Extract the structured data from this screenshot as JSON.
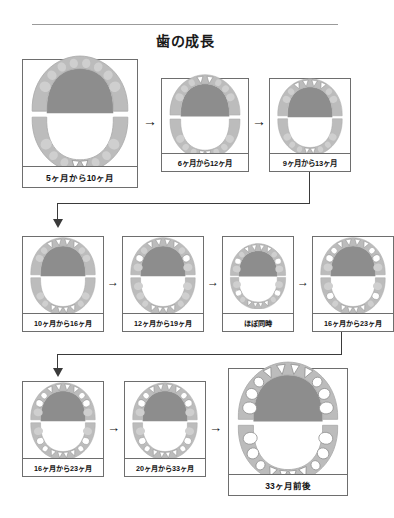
{
  "document": {
    "title": "歯の成長",
    "rule": "horizontal-rule"
  },
  "arrow_glyph": "→",
  "panels": [
    {
      "id": "p1",
      "caption": "5ヶ月から10ヶ月",
      "row": 1,
      "col": 1,
      "size": "large"
    },
    {
      "id": "p2",
      "caption": "6ヶ月から12ヶ月",
      "row": 1,
      "col": 2,
      "size": "small"
    },
    {
      "id": "p3",
      "caption": "9ヶ月から13ヶ月",
      "row": 1,
      "col": 3,
      "size": "small"
    },
    {
      "id": "p4",
      "caption": "10ヶ月から16ヶ月",
      "row": 2,
      "col": 1,
      "size": "small"
    },
    {
      "id": "p5",
      "caption": "12ヶ月から19ヶ月",
      "row": 2,
      "col": 2,
      "size": "small"
    },
    {
      "id": "p6",
      "caption": "ほぼ同時",
      "row": 2,
      "col": 3,
      "size": "small"
    },
    {
      "id": "p7",
      "caption": "16ヶ月から23ヶ月",
      "row": 2,
      "col": 4,
      "size": "small"
    },
    {
      "id": "p8",
      "caption": "16ヶ月から23ヶ月",
      "row": 3,
      "col": 1,
      "size": "small"
    },
    {
      "id": "p9",
      "caption": "20ヶ月から33ヶ月",
      "row": 3,
      "col": 2,
      "size": "small"
    },
    {
      "id": "p10",
      "caption": "33ヶ月前後",
      "row": 3,
      "col": 3,
      "size": "large"
    }
  ],
  "colors": {
    "palate": "#8d8d8d",
    "gum": "#bcbcbc",
    "unerupted_tooth": "#cfcfcf",
    "erupted_tooth": "#ffffff",
    "tooth_outline": "#8f8f8f",
    "panel_border": "#6e6e6e",
    "connector": "#3a3a3a",
    "text": "#121212",
    "rule": "#9b9b9b"
  },
  "chart_data": {
    "type": "diagram",
    "title": "歯の成長",
    "stages": [
      {
        "caption": "5ヶ月から10ヶ月",
        "upper_erupted": [],
        "lower_erupted": [
          "lower-central-incisors"
        ]
      },
      {
        "caption": "6ヶ月から12ヶ月",
        "upper_erupted": [
          "upper-central-incisors"
        ],
        "lower_erupted": [
          "lower-central-incisors"
        ]
      },
      {
        "caption": "9ヶ月から13ヶ月",
        "upper_erupted": [
          "upper-central-incisors",
          "upper-lateral-incisors"
        ],
        "lower_erupted": [
          "lower-central-incisors"
        ]
      },
      {
        "caption": "10ヶ月から16ヶ月",
        "upper_erupted": [
          "upper-central-incisors",
          "upper-lateral-incisors"
        ],
        "lower_erupted": [
          "lower-central-incisors",
          "lower-lateral-incisors"
        ]
      },
      {
        "caption": "12ヶ月から19ヶ月",
        "upper_erupted": [
          "upper-incisors",
          "upper-first-molars"
        ],
        "lower_erupted": [
          "lower-incisors"
        ]
      },
      {
        "caption": "ほぼ同時",
        "upper_erupted": [
          "upper-incisors",
          "upper-first-molars"
        ],
        "lower_erupted": [
          "lower-incisors",
          "lower-first-molars"
        ]
      },
      {
        "caption": "16ヶ月から23ヶ月",
        "upper_erupted": [
          "upper-incisors",
          "upper-canines",
          "upper-first-molars"
        ],
        "lower_erupted": [
          "lower-incisors",
          "lower-first-molars"
        ]
      },
      {
        "caption": "16ヶ月から23ヶ月",
        "upper_erupted": [
          "upper-incisors",
          "upper-canines",
          "upper-first-molars"
        ],
        "lower_erupted": [
          "lower-incisors",
          "lower-canines",
          "lower-first-molars"
        ]
      },
      {
        "caption": "20ヶ月から33ヶ月",
        "upper_erupted": [
          "upper-incisors",
          "upper-canines",
          "upper-first-molars"
        ],
        "lower_erupted": [
          "lower-incisors",
          "lower-canines",
          "lower-first-molars"
        ]
      },
      {
        "caption": "33ヶ月前後",
        "upper_erupted": [
          "all-upper-primary-teeth"
        ],
        "lower_erupted": [
          "all-lower-primary-teeth"
        ]
      }
    ],
    "flow": [
      [
        "5ヶ月から10ヶ月",
        "6ヶ月から12ヶ月"
      ],
      [
        "6ヶ月から12ヶ月",
        "9ヶ月から13ヶ月"
      ],
      [
        "9ヶ月から13ヶ月",
        "10ヶ月から16ヶ月"
      ],
      [
        "10ヶ月から16ヶ月",
        "12ヶ月から19ヶ月"
      ],
      [
        "12ヶ月から19ヶ月",
        "ほぼ同時"
      ],
      [
        "ほぼ同時",
        "16ヶ月から23ヶ月"
      ],
      [
        "16ヶ月から23ヶ月",
        "16ヶ月から23ヶ月"
      ],
      [
        "16ヶ月から23ヶ月",
        "20ヶ月から33ヶ月"
      ],
      [
        "20ヶ月から33ヶ月",
        "33ヶ月前後"
      ]
    ]
  }
}
